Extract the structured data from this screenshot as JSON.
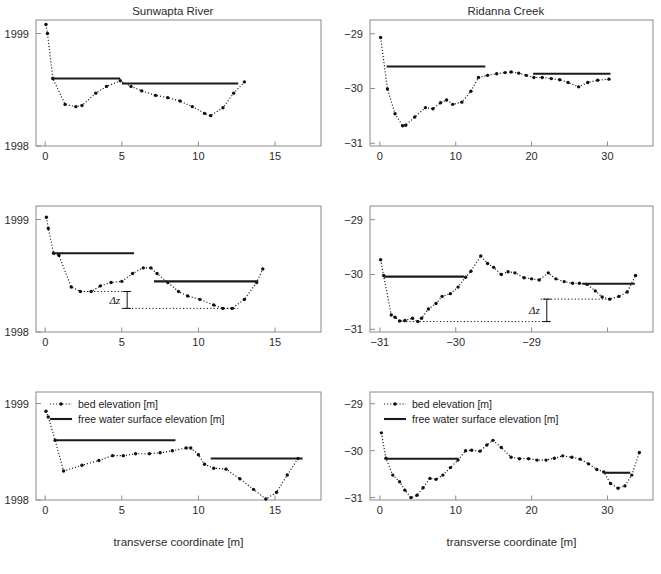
{
  "figure": {
    "xlabel": "transverse coordinate [m]",
    "legend": {
      "bed": "bed elevation [m]",
      "water": "free water surface elevation [m]"
    },
    "delta_label": "Δz",
    "colors": {
      "line": "#111111",
      "axis": "#8a8a8a",
      "text": "#2b2b2b"
    }
  },
  "chart_data": [
    {
      "type": "scatter",
      "panel": "top-left",
      "title": "Sunwapta River",
      "xlabel": "",
      "ylabel": "",
      "xlim": [
        -0.6,
        18.0
      ],
      "ylim": [
        1998.0,
        1999.12
      ],
      "xticks": [
        0,
        5,
        10,
        15
      ],
      "yticks": [
        1998,
        1999
      ],
      "xticklabels": [
        "0",
        "5",
        "10",
        "15"
      ],
      "yticklabels": [
        "1998",
        "1999"
      ],
      "grid": false,
      "legend": false,
      "series": [
        {
          "name": "bed elevation [m]",
          "style": "dotted-with-markers",
          "x": [
            0.05,
            0.15,
            0.5,
            1.3,
            2.0,
            2.4,
            3.3,
            4.0,
            4.9,
            5.6,
            6.3,
            7.2,
            8.0,
            8.8,
            9.6,
            10.4,
            10.8,
            11.6,
            12.3,
            13.0
          ],
          "y": [
            1999.08,
            1999.0,
            1998.6,
            1998.37,
            1998.35,
            1998.36,
            1998.47,
            1998.53,
            1998.58,
            1998.53,
            1998.49,
            1998.45,
            1998.43,
            1998.4,
            1998.35,
            1998.29,
            1998.27,
            1998.34,
            1998.47,
            1998.57
          ]
        },
        {
          "name": "free water surface elevation [m]",
          "style": "solid-segments",
          "segments": [
            {
              "x0": 0.4,
              "x1": 4.9,
              "y": 1998.6
            },
            {
              "x0": 5.0,
              "x1": 12.6,
              "y": 1998.555
            }
          ]
        }
      ],
      "annotations": []
    },
    {
      "type": "scatter",
      "panel": "top-right",
      "title": "Ridanna Creek",
      "xlabel": "",
      "ylabel": "",
      "xlim": [
        -1.3,
        36.0
      ],
      "ylim": [
        -31.05,
        -28.75
      ],
      "xticks": [
        0,
        10,
        20,
        30
      ],
      "yticks": [
        -31,
        -30,
        -29
      ],
      "xticklabels": [
        "0",
        "10",
        "20",
        "30"
      ],
      "yticklabels": [
        "−31",
        "−30",
        "−29"
      ],
      "grid": false,
      "legend": false,
      "series": [
        {
          "name": "bed elevation [m]",
          "style": "dotted-with-markers",
          "x": [
            0.1,
            1.0,
            2.0,
            3.0,
            3.4,
            4.6,
            6.0,
            7.0,
            8.0,
            8.8,
            9.6,
            10.8,
            12.0,
            13.0,
            14.2,
            15.4,
            16.5,
            17.3,
            18.3,
            19.3,
            20.3,
            21.4,
            22.6,
            23.7,
            24.8,
            26.2,
            27.4,
            28.7,
            30.2
          ],
          "y": [
            -29.07,
            -30.01,
            -30.46,
            -30.68,
            -30.67,
            -30.52,
            -30.35,
            -30.37,
            -30.26,
            -30.21,
            -30.29,
            -30.25,
            -30.05,
            -29.8,
            -29.76,
            -29.73,
            -29.71,
            -29.7,
            -29.72,
            -29.76,
            -29.8,
            -29.8,
            -29.82,
            -29.84,
            -29.89,
            -29.97,
            -29.89,
            -29.85,
            -29.83
          ]
        },
        {
          "name": "free water surface elevation [m]",
          "style": "solid-segments",
          "segments": [
            {
              "x0": 0.9,
              "x1": 13.9,
              "y": -29.6
            },
            {
              "x0": 20.2,
              "x1": 30.4,
              "y": -29.73
            }
          ]
        }
      ],
      "annotations": []
    },
    {
      "type": "scatter",
      "panel": "middle-left",
      "title": "",
      "xlabel": "",
      "ylabel": "",
      "xlim": [
        -0.6,
        18.0
      ],
      "ylim": [
        1998.0,
        1999.12
      ],
      "xticks": [
        0,
        5,
        10,
        15
      ],
      "yticks": [
        1998,
        1999
      ],
      "xticklabels": [
        "0",
        "5",
        "10",
        "15"
      ],
      "yticklabels": [
        "1998",
        "1999"
      ],
      "grid": false,
      "legend": false,
      "series": [
        {
          "name": "bed elevation [m]",
          "style": "dotted-with-markers",
          "x": [
            0.08,
            0.2,
            0.55,
            0.9,
            1.7,
            2.3,
            3.0,
            3.6,
            4.3,
            5.0,
            5.7,
            6.4,
            6.9,
            7.3,
            8.0,
            8.7,
            9.3,
            10.1,
            11.0,
            11.6,
            12.2,
            13.0,
            13.8,
            14.2
          ],
          "y": [
            1999.02,
            1998.92,
            1998.7,
            1998.68,
            1998.4,
            1998.36,
            1998.36,
            1998.41,
            1998.44,
            1998.45,
            1998.52,
            1998.57,
            1998.57,
            1998.52,
            1998.44,
            1998.36,
            1998.32,
            1998.29,
            1998.24,
            1998.21,
            1998.21,
            1998.29,
            1998.44,
            1998.56
          ]
        },
        {
          "name": "free water surface elevation [m]",
          "style": "solid-segments",
          "segments": [
            {
              "x0": 0.55,
              "x1": 5.8,
              "y": 1998.7
            },
            {
              "x0": 7.1,
              "x1": 13.9,
              "y": 1998.45
            }
          ]
        }
      ],
      "annotations": [
        {
          "type": "delta-z",
          "label": "Δz",
          "x_upper_from": 2.3,
          "x_upper_to": 5.5,
          "y_upper": 1998.36,
          "x_lower_from": 5.0,
          "x_lower_to": 12.6,
          "y_lower": 1998.21,
          "x_bar": 5.35
        }
      ]
    },
    {
      "type": "scatter",
      "panel": "middle-right",
      "title": "",
      "xlabel": "",
      "ylabel": "",
      "xlim": [
        -1.3,
        36.0
      ],
      "ylim": [
        -31.05,
        -28.75
      ],
      "xticks": [
        0,
        10,
        20,
        30
      ],
      "yticks": [
        -31,
        -30,
        -29
      ],
      "xticklabels": [
        "−31",
        "−30",
        "−29"
      ],
      "yticklabels": [
        "−31",
        "−30",
        "−29"
      ],
      "grid": false,
      "legend": false,
      "series": [
        {
          "name": "bed elevation [m]",
          "style": "dotted-with-markers",
          "x": [
            0.1,
            0.5,
            1.5,
            2.0,
            2.6,
            3.3,
            4.3,
            5.0,
            5.5,
            6.4,
            7.4,
            8.2,
            9.3,
            10.3,
            11.3,
            12.0,
            13.3,
            14.2,
            15.0,
            16.0,
            16.9,
            17.8,
            19.0,
            20.0,
            21.0,
            22.2,
            23.2,
            24.3,
            25.4,
            26.3,
            27.3,
            28.4,
            29.3,
            30.3,
            31.5,
            32.6,
            33.7
          ],
          "y": [
            -29.73,
            -30.02,
            -30.74,
            -30.78,
            -30.85,
            -30.84,
            -30.8,
            -30.86,
            -30.8,
            -30.63,
            -30.53,
            -30.4,
            -30.35,
            -30.23,
            -30.05,
            -29.94,
            -29.66,
            -29.8,
            -29.87,
            -30.0,
            -29.95,
            -29.97,
            -30.06,
            -30.08,
            -30.1,
            -29.97,
            -30.08,
            -30.13,
            -30.16,
            -30.16,
            -30.18,
            -30.3,
            -30.41,
            -30.45,
            -30.4,
            -30.32,
            -30.02
          ]
        },
        {
          "name": "free water surface elevation [m]",
          "style": "solid-segments",
          "segments": [
            {
              "x0": 0.5,
              "x1": 11.1,
              "y": -30.04
            },
            {
              "x0": 26.7,
              "x1": 33.6,
              "y": -30.17
            }
          ]
        }
      ],
      "annotations": [
        {
          "type": "delta-z",
          "label": "Δz",
          "x_upper_from": 21.2,
          "x_upper_to": 30.6,
          "y_upper": -30.45,
          "x_lower_from": 3.0,
          "x_lower_to": 22.5,
          "y_lower": -30.86,
          "x_bar": 22.0
        }
      ]
    },
    {
      "type": "scatter",
      "panel": "bottom-left",
      "title": "",
      "xlabel": "transverse coordinate [m]",
      "ylabel": "",
      "xlim": [
        -0.6,
        18.0
      ],
      "ylim": [
        1998.0,
        1999.12
      ],
      "xticks": [
        0,
        5,
        10,
        15
      ],
      "yticks": [
        1998,
        1999
      ],
      "xticklabels": [
        "0",
        "5",
        "10",
        "15"
      ],
      "yticklabels": [
        "1998",
        "1999"
      ],
      "grid": false,
      "legend": true,
      "series": [
        {
          "name": "bed elevation [m]",
          "style": "dotted-with-markers",
          "x": [
            0.05,
            0.2,
            0.65,
            1.2,
            2.4,
            3.5,
            4.4,
            5.1,
            5.9,
            6.8,
            7.5,
            8.3,
            9.2,
            9.5,
            10.0,
            10.4,
            11.0,
            11.8,
            12.7,
            13.6,
            14.4,
            15.1,
            15.8,
            16.5
          ],
          "y": [
            1998.92,
            1998.86,
            1998.62,
            1998.3,
            1998.36,
            1998.41,
            1998.46,
            1998.46,
            1998.48,
            1998.48,
            1998.49,
            1998.51,
            1998.54,
            1998.54,
            1998.47,
            1998.37,
            1998.33,
            1998.32,
            1998.22,
            1998.11,
            1998.01,
            1998.08,
            1998.26,
            1998.43
          ]
        },
        {
          "name": "free water surface elevation [m]",
          "style": "solid-segments",
          "segments": [
            {
              "x0": 0.6,
              "x1": 8.5,
              "y": 1998.62
            },
            {
              "x0": 10.8,
              "x1": 16.8,
              "y": 1998.43
            }
          ]
        }
      ],
      "annotations": []
    },
    {
      "type": "scatter",
      "panel": "bottom-right",
      "title": "",
      "xlabel": "transverse coordinate [m]",
      "ylabel": "",
      "xlim": [
        -1.3,
        36.0
      ],
      "ylim": [
        -31.05,
        -28.75
      ],
      "xticks": [
        0,
        10,
        20,
        30
      ],
      "yticks": [
        -31,
        -30,
        -29
      ],
      "xticklabels": [
        "0",
        "10",
        "20",
        "30"
      ],
      "yticklabels": [
        "−31",
        "−30",
        "−29"
      ],
      "grid": false,
      "legend": true,
      "series": [
        {
          "name": "bed elevation [m]",
          "style": "dotted-with-markers",
          "x": [
            0.2,
            0.8,
            1.7,
            2.6,
            3.3,
            4.1,
            4.9,
            5.7,
            6.6,
            7.4,
            8.3,
            9.3,
            10.3,
            11.3,
            12.1,
            13.2,
            14.1,
            14.9,
            16.0,
            17.3,
            18.4,
            19.6,
            20.7,
            21.9,
            23.0,
            24.1,
            25.3,
            26.4,
            27.5,
            28.6,
            29.5,
            30.4,
            31.4,
            32.3,
            33.2,
            34.2
          ],
          "y": [
            -29.62,
            -30.16,
            -30.52,
            -30.66,
            -30.84,
            -31.0,
            -30.95,
            -30.79,
            -30.59,
            -30.61,
            -30.52,
            -30.36,
            -30.2,
            -30.0,
            -29.99,
            -30.01,
            -29.88,
            -29.78,
            -29.93,
            -30.14,
            -30.17,
            -30.17,
            -30.2,
            -30.2,
            -30.16,
            -30.11,
            -30.14,
            -30.18,
            -30.28,
            -30.4,
            -30.45,
            -30.7,
            -30.8,
            -30.75,
            -30.52,
            -30.04
          ]
        },
        {
          "name": "free water surface elevation [m]",
          "style": "solid-segments",
          "segments": [
            {
              "x0": 0.7,
              "x1": 10.4,
              "y": -30.17
            },
            {
              "x0": 29.5,
              "x1": 33.0,
              "y": -30.47
            }
          ]
        }
      ],
      "annotations": []
    }
  ]
}
